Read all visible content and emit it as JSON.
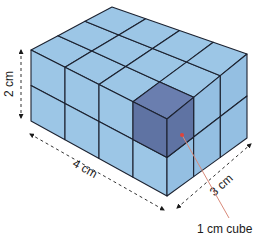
{
  "figure": {
    "dimensions": {
      "length": {
        "label": "4 cm",
        "cubes": 4
      },
      "depth": {
        "label": "3 cm",
        "cubes": 3
      },
      "height": {
        "label": "2 cm",
        "cubes": 2
      }
    },
    "callout": {
      "label": "1 cm cube"
    },
    "colors": {
      "cube_fill": "#9cc6e6",
      "cube_fill_right": "#94bfe2",
      "highlight_fill": "#5f73a3",
      "highlight_top": "#6a7eaf",
      "edge": "#1c2230",
      "dimension_line": "#333333",
      "callout_line": "#d98a7a",
      "callout_dot": "#e0443a"
    },
    "vertices": {
      "top_left": [
        31,
        50
      ],
      "top_back": [
        112,
        7
      ],
      "top_right": [
        247,
        54
      ],
      "top_front": [
        167,
        119
      ],
      "bottom_left": [
        31,
        121
      ],
      "bottom_front": [
        167,
        196
      ],
      "bottom_right": [
        247,
        138
      ]
    }
  }
}
